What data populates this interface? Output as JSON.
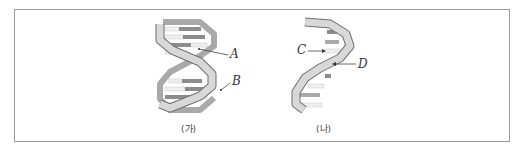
{
  "figure": {
    "panels": [
      {
        "id": "ga",
        "caption": "(가)",
        "description": "double-stranded helix",
        "labels": [
          {
            "text": "A",
            "points_to": "base pair (inner rung)"
          },
          {
            "text": "B",
            "points_to": "backbone strand"
          }
        ]
      },
      {
        "id": "na",
        "caption": "(나)",
        "description": "single-stranded helix",
        "labels": [
          {
            "text": "C",
            "points_to": "base (rung)"
          },
          {
            "text": "D",
            "points_to": "backbone strand"
          }
        ]
      }
    ],
    "colors": {
      "frame": "#9a9a9a",
      "strand_fill": "#d8d8d8",
      "strand_dark": "#a9a9a9",
      "strand_edge": "#6f6f6f",
      "base_dark": "#8c8c8c",
      "base_light": "#efefef"
    }
  }
}
